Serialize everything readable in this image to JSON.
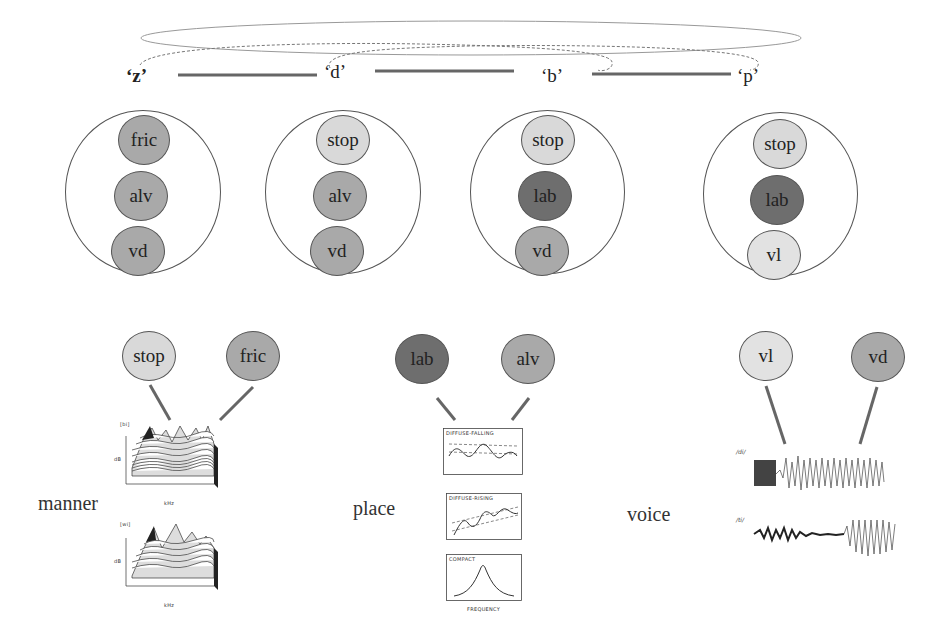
{
  "sequence": {
    "segments": [
      {
        "label": "‘z’"
      },
      {
        "label": "‘d’"
      },
      {
        "label": "‘b’"
      },
      {
        "label": "‘p’"
      }
    ]
  },
  "feature_bundles": [
    {
      "segment": "z",
      "features": [
        {
          "label": "fric",
          "color": "#a9a9a9"
        },
        {
          "label": "alv",
          "color": "#a9a9a9"
        },
        {
          "label": "vd",
          "color": "#a9a9a9"
        }
      ]
    },
    {
      "segment": "d",
      "features": [
        {
          "label": "stop",
          "color": "#d9d9d9"
        },
        {
          "label": "alv",
          "color": "#a9a9a9"
        },
        {
          "label": "vd",
          "color": "#a9a9a9"
        }
      ]
    },
    {
      "segment": "b",
      "features": [
        {
          "label": "stop",
          "color": "#d9d9d9"
        },
        {
          "label": "lab",
          "color": "#6e6e6e"
        },
        {
          "label": "vd",
          "color": "#a9a9a9"
        }
      ]
    },
    {
      "segment": "p",
      "features": [
        {
          "label": "stop",
          "color": "#d9d9d9"
        },
        {
          "label": "lab",
          "color": "#6e6e6e"
        },
        {
          "label": "vl",
          "color": "#e2e2e2"
        }
      ]
    }
  ],
  "dimensions": [
    {
      "name": "manner",
      "label": "manner",
      "features": [
        {
          "label": "stop",
          "color": "#d9d9d9"
        },
        {
          "label": "fric",
          "color": "#a9a9a9"
        }
      ],
      "plots": [
        {
          "tag": "[bi]",
          "y_axis": "dB",
          "y_ticks": [
            "100",
            "80",
            "60",
            "40",
            "20",
            "0"
          ],
          "x_axis": "kHz",
          "x_ticks": [
            "0",
            "1",
            "2",
            "3",
            "4",
            "5"
          ],
          "z_ticks": [
            "180",
            "112",
            "75",
            "37",
            "0"
          ],
          "z_unit": "ms"
        },
        {
          "tag": "[wi]",
          "y_axis": "dB",
          "y_ticks": [
            "100",
            "80",
            "60",
            "40",
            "20",
            "0"
          ],
          "x_axis": "kHz",
          "x_ticks": [
            "0",
            "1",
            "2",
            "3",
            "4",
            "5"
          ],
          "z_ticks": [
            "150",
            "112",
            "75",
            "37",
            "0"
          ],
          "z_unit": "ms"
        }
      ]
    },
    {
      "name": "place",
      "label": "place",
      "features": [
        {
          "label": "lab",
          "color": "#6e6e6e"
        },
        {
          "label": "alv",
          "color": "#a9a9a9"
        }
      ],
      "plots": [
        {
          "title": "DIFFUSE-FALLING"
        },
        {
          "title": "DIFFUSE-RISING"
        },
        {
          "title": "COMPACT",
          "x_axis": "FREQUENCY"
        }
      ]
    },
    {
      "name": "voice",
      "label": "voice",
      "features": [
        {
          "label": "vl",
          "color": "#e2e2e2"
        },
        {
          "label": "vd",
          "color": "#a9a9a9"
        }
      ],
      "plots": [
        {
          "tag": "/di/"
        },
        {
          "tag": "/ti/"
        }
      ]
    }
  ]
}
